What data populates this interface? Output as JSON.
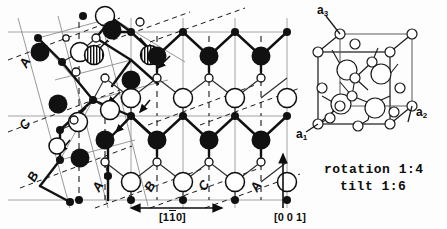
{
  "figure": {
    "background_color": "#fdfdfd",
    "ink_color": "#0d0d0d"
  },
  "projection_panel": {
    "name": "stacking-projection",
    "stacking_labels_left": [
      {
        "text": "A",
        "x": 26,
        "y": 68
      },
      {
        "text": "C",
        "x": 24,
        "y": 128
      },
      {
        "text": "B",
        "x": 32,
        "y": 178
      }
    ],
    "stacking_labels_bottom": [
      {
        "text": "A",
        "x": 98,
        "y": 189
      },
      {
        "text": "B",
        "x": 148,
        "y": 189
      },
      {
        "text": "C",
        "x": 203,
        "y": 188
      },
      {
        "text": "A",
        "x": 255,
        "y": 189
      }
    ],
    "direction_horizontal": {
      "label_prefix": "[1",
      "label_bar": "1",
      "label_suffix": "0]",
      "full": "[1 1̄ 0]",
      "arrow": "double-headed-horizontal"
    },
    "direction_vertical": {
      "full": "[0 0 1]",
      "arrow": "single-headed-up"
    },
    "atom_legend": [
      {
        "kind": "large-filled",
        "fill": "#111111",
        "radius": 9.5
      },
      {
        "kind": "large-open",
        "fill": "#ffffff",
        "stroke": "#0d0d0d",
        "radius": 9.5
      },
      {
        "kind": "small-filled",
        "fill": "#111111",
        "radius": 4.0
      },
      {
        "kind": "small-open",
        "fill": "#ffffff",
        "stroke": "#0d0d0d",
        "radius": 4.0
      },
      {
        "kind": "hatched",
        "fill": "vertical-stripes",
        "radius": 9.5
      }
    ]
  },
  "unit_cell_panel": {
    "name": "cubic-unit-cell",
    "axes": [
      {
        "id": "a3",
        "letter": "a",
        "subscript": "3",
        "x": 317,
        "y": 8
      },
      {
        "id": "a2",
        "letter": "a",
        "subscript": "2",
        "x": 416,
        "y": 113
      },
      {
        "id": "a1",
        "letter": "a",
        "subscript": "1",
        "x": 298,
        "y": 126
      }
    ]
  },
  "notes": {
    "rotation_label": "rotation 1:4",
    "tilt_label": "tilt  1:6"
  }
}
